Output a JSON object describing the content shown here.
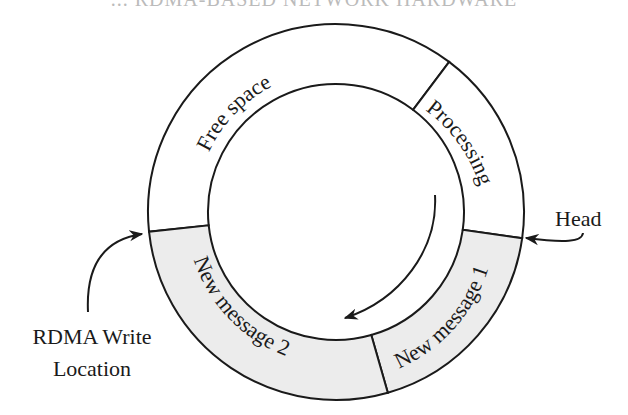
{
  "header": {
    "clipped_text": "... RDMA-BASED NETWORK HARDWARE"
  },
  "diagram": {
    "center": [
      336,
      212
    ],
    "outer_radius": 188,
    "inner_radius": 128,
    "colors": {
      "stroke": "#1a1a1a",
      "shaded": "#ececec",
      "unshaded": "#ffffff"
    },
    "segments": [
      {
        "id": "free-space",
        "label": "Free  space",
        "start_deg": 174,
        "end_deg": 307,
        "shaded": false
      },
      {
        "id": "processing",
        "label": "Processing",
        "start_deg": 307,
        "end_deg": 368,
        "shaded": false
      },
      {
        "id": "new-message-1",
        "label": "New message 1",
        "start_deg": 8,
        "end_deg": 74,
        "shaded": true
      },
      {
        "id": "new-message-2",
        "label": "New message 2",
        "start_deg": 74,
        "end_deg": 174,
        "shaded": true
      }
    ],
    "annotations": {
      "head": "Head",
      "rdma_line1": "RDMA Write",
      "rdma_line2": "Location"
    }
  }
}
